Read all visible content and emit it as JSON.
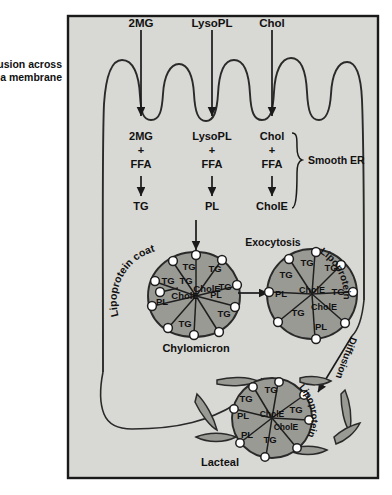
{
  "figure": {
    "background_color": "#ffffff",
    "cell_fill": "#d8d8d4",
    "particle_fill": "#9a9a95",
    "outline_color": "#1a1a1a"
  },
  "left_labels": {
    "diffusion_line1": "Diffusion across",
    "diffusion_line2": "plasma membrane"
  },
  "apical_substrates": [
    {
      "name": "2MG",
      "x": 141
    },
    {
      "name": "LysoPL",
      "x": 212
    },
    {
      "name": "Chol",
      "x": 272
    }
  ],
  "pathways": [
    {
      "id": "mg-pathway",
      "substrate": "2MG",
      "plus": "+",
      "cofactor": "FFA",
      "product": "TG",
      "x": 141
    },
    {
      "id": "lysopl-pathway",
      "substrate": "LysoPL",
      "plus": "+",
      "cofactor": "FFA",
      "product": "PL",
      "x": 212
    },
    {
      "id": "chol-pathway",
      "substrate": "Chol",
      "plus": "+",
      "cofactor": "FFA",
      "product": "CholE",
      "x": 272
    }
  ],
  "organelle_label": "Smooth ER",
  "chylomicron": {
    "coat_label": "Lipoprotein coat",
    "name_label": "Chylomicron",
    "contents": [
      "TG",
      "TG",
      "TG",
      "TG",
      "TG",
      "TG",
      "TG",
      "PL",
      "PL",
      "CholE",
      "CholE"
    ]
  },
  "exocytosis": {
    "label": "Exocytosis",
    "coat_label": "Lipoprotein",
    "contents": [
      "TG",
      "TG",
      "TG",
      "TG",
      "TG",
      "PL",
      "PL",
      "CholE",
      "CholE"
    ]
  },
  "diffusion_to_lacteal": {
    "label": "Diffusion"
  },
  "lacteal": {
    "label": "Lacteal",
    "particle_coat_label": "Lipoprotein",
    "contents": [
      "TG",
      "TG",
      "TG",
      "TG",
      "PL",
      "PL",
      "CholE",
      "CholE"
    ]
  }
}
